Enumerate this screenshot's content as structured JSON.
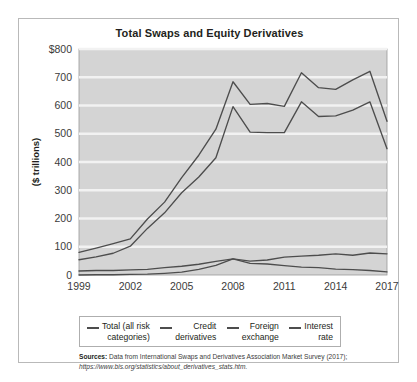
{
  "figure": {
    "title": "Total Swaps and Equity Derivatives",
    "source_label": "Sources:",
    "source_text": "Data from International Swaps and Derivatives Association Market Survey (2017);",
    "source_url": "https://www.bis.org/statistics/about_derivatives_stats.htm."
  },
  "legend": {
    "items": [
      {
        "label": "Total (all risk\ncategories)",
        "color": "#4d4d4d"
      },
      {
        "label": "Credit\nderivatives",
        "color": "#4d4d4d"
      },
      {
        "label": "Foreign\nexchange",
        "color": "#4d4d4d"
      },
      {
        "label": "Interest\nrate",
        "color": "#4d4d4d"
      }
    ]
  },
  "chart_data": {
    "type": "line",
    "title": "Total Swaps and Equity Derivatives",
    "xlabel": "",
    "ylabel": "($ trillions)",
    "xlim": [
      1999,
      2017
    ],
    "ylim": [
      0,
      800
    ],
    "ytick_values": [
      0,
      100,
      200,
      300,
      400,
      500,
      600,
      700,
      800
    ],
    "ytick_labels": [
      "0",
      "100",
      "200",
      "300",
      "400",
      "500",
      "600",
      "700",
      "$800"
    ],
    "xtick_values": [
      1999,
      2002,
      2005,
      2008,
      2011,
      2014,
      2017
    ],
    "xtick_labels": [
      "1999",
      "2002",
      "2005",
      "2008",
      "2011",
      "2014",
      "2017"
    ],
    "grid": "horizontal",
    "legend_position": "below",
    "plot_background": "#d4d4d4",
    "gridline_color": "#f2f2f2",
    "x": [
      1999,
      2000,
      2001,
      2002,
      2003,
      2004,
      2005,
      2006,
      2007,
      2008,
      2009,
      2010,
      2011,
      2012,
      2013,
      2014,
      2015,
      2016,
      2017
    ],
    "series": [
      {
        "name": "Total (all risk categories)",
        "color": "#4d4d4d",
        "values": [
          80,
          95,
          111,
          128,
          198,
          258,
          345,
          424,
          516,
          684,
          604,
          607,
          597,
          716,
          663,
          657,
          691,
          721,
          544
        ]
      },
      {
        "name": "Credit derivatives",
        "color": "#4d4d4d",
        "values": [
          0,
          1,
          1,
          2,
          3,
          6,
          10,
          20,
          34,
          57,
          41,
          39,
          33,
          28,
          26,
          21,
          19,
          16,
          11
        ]
      },
      {
        "name": "Foreign exchange",
        "color": "#4d4d4d",
        "values": [
          14,
          16,
          16,
          18,
          20,
          26,
          31,
          38,
          48,
          57,
          49,
          53,
          63,
          67,
          70,
          75,
          70,
          78,
          75
        ]
      },
      {
        "name": "Interest rate",
        "color": "#4d4d4d",
        "values": [
          54,
          64,
          77,
          102,
          165,
          220,
          291,
          347,
          415,
          596,
          506,
          504,
          504,
          613,
          561,
          563,
          584,
          613,
          447
        ]
      }
    ]
  }
}
